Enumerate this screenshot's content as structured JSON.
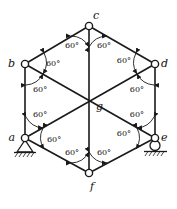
{
  "figure": {
    "type": "statics-truss-diagram",
    "background_color": "#ffffff",
    "line_color": "#1a1a1a"
  },
  "nodes": [
    {
      "id": "a",
      "label": "a",
      "x": 25,
      "y": 138,
      "joint": "circle",
      "label_dx": -10,
      "label_dy": 3,
      "support": "pin"
    },
    {
      "id": "b",
      "label": "b",
      "x": 25,
      "y": 64,
      "joint": "circle",
      "label_dx": -10,
      "label_dy": 3,
      "support": "none"
    },
    {
      "id": "c",
      "label": "c",
      "x": 89,
      "y": 26,
      "joint": "circle",
      "label_dx": 4,
      "label_dy": -7,
      "support": "none"
    },
    {
      "id": "d",
      "label": "d",
      "x": 155,
      "y": 64,
      "joint": "circle",
      "label_dx": 6,
      "label_dy": 3,
      "support": "none"
    },
    {
      "id": "e",
      "label": "e",
      "x": 155,
      "y": 138,
      "joint": "circle",
      "label_dx": 6,
      "label_dy": 3,
      "support": "roller"
    },
    {
      "id": "f",
      "label": "f",
      "x": 89,
      "y": 173,
      "joint": "circle",
      "label_dx": 1,
      "label_dy": 17,
      "support": "none"
    },
    {
      "id": "g",
      "label": "g",
      "x": 89,
      "y": 101,
      "joint": "none",
      "label_dx": 7,
      "label_dy": 9,
      "support": "none"
    }
  ],
  "members": [
    {
      "from": "a",
      "to": "b"
    },
    {
      "from": "b",
      "to": "c"
    },
    {
      "from": "c",
      "to": "d"
    },
    {
      "from": "d",
      "to": "e"
    },
    {
      "from": "e",
      "to": "f"
    },
    {
      "from": "f",
      "to": "a"
    },
    {
      "from": "a",
      "to": "d"
    },
    {
      "from": "b",
      "to": "e"
    },
    {
      "from": "c",
      "to": "f"
    }
  ],
  "angles": [
    {
      "id": "c-left",
      "value": "60°",
      "at": "c",
      "label_x": 72,
      "label_y": 48
    },
    {
      "id": "c-right",
      "value": "60°",
      "at": "c",
      "label_x": 104,
      "label_y": 48
    },
    {
      "id": "b-upper",
      "value": "60°",
      "at": "b",
      "label_x": 46,
      "label_y": 66
    },
    {
      "id": "b-lower",
      "value": "60°",
      "at": "b",
      "label_x": 41,
      "label_y": 88
    },
    {
      "id": "d-upper",
      "value": "60°",
      "at": "d",
      "label_x": 131,
      "label_y": 63
    },
    {
      "id": "d-lower",
      "value": "60°",
      "at": "d",
      "label_x": 137,
      "label_y": 88
    },
    {
      "id": "a-upper",
      "value": "60°",
      "at": "a",
      "label_x": 41,
      "label_y": 119
    },
    {
      "id": "a-lower",
      "value": "60°",
      "at": "a",
      "label_x": 47,
      "label_y": 141
    },
    {
      "id": "e-upper",
      "value": "60°",
      "at": "e",
      "label_x": 137,
      "label_y": 119
    },
    {
      "id": "e-lower",
      "value": "60°",
      "at": "e",
      "label_x": 129,
      "label_y": 137
    },
    {
      "id": "f-left",
      "value": "60°",
      "at": "f",
      "label_x": 72,
      "label_y": 155
    },
    {
      "id": "f-right",
      "value": "60°",
      "at": "f",
      "label_x": 104,
      "label_y": 155
    }
  ],
  "supports": [
    {
      "id": "support-a",
      "type": "pin",
      "node": "a",
      "hatched": true
    },
    {
      "id": "support-e",
      "type": "roller",
      "node": "e",
      "hatched": true
    }
  ]
}
